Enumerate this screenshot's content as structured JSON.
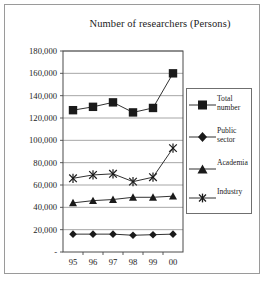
{
  "chart_data": {
    "type": "line",
    "title": "Number of researchers (Persons)",
    "xlabel": "",
    "ylabel": "",
    "categories": [
      "95",
      "96",
      "97",
      "98",
      "99",
      "00"
    ],
    "ylim": [
      0,
      180000
    ],
    "ytick_values": [
      0,
      20000,
      40000,
      60000,
      80000,
      100000,
      120000,
      140000,
      160000,
      180000
    ],
    "ytick_labels": [
      "-",
      "20,000",
      "40,000",
      "60,000",
      "80,000",
      "100,000",
      "120,000",
      "140,000",
      "160,000",
      "180,000"
    ],
    "grid": true,
    "legend_position": "right",
    "series": [
      {
        "name": "Total number",
        "marker": "square",
        "values": [
          127000,
          130000,
          134000,
          125000,
          129000,
          160000
        ]
      },
      {
        "name": "Public sector",
        "marker": "diamond",
        "values": [
          16000,
          16000,
          16000,
          15000,
          15500,
          16000
        ]
      },
      {
        "name": "Academia",
        "marker": "triangle",
        "values": [
          44000,
          46000,
          47000,
          49000,
          49000,
          50000
        ]
      },
      {
        "name": "Industry",
        "marker": "cross",
        "values": [
          66000,
          69000,
          70000,
          63000,
          67000,
          93000
        ]
      }
    ]
  },
  "legend": {
    "items": [
      {
        "label_line1": "Total",
        "label_line2": "number",
        "marker": "square"
      },
      {
        "label_line1": "Public",
        "label_line2": "sector",
        "marker": "diamond"
      },
      {
        "label_line1": "Academia",
        "label_line2": "",
        "marker": "triangle"
      },
      {
        "label_line1": "Industry",
        "label_line2": "",
        "marker": "cross"
      }
    ]
  },
  "colors": {
    "series": "#1a1a1a",
    "grid": "#8f8f8f",
    "axis": "#4a4a4a",
    "frame": "#9a9a9a",
    "background": "#ffffff"
  }
}
